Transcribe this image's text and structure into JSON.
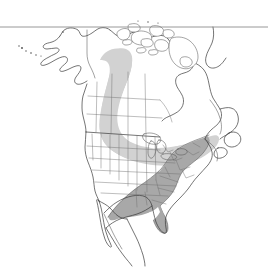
{
  "figure": {
    "kind": "species-range-map",
    "region": "North America",
    "background_color": "#ffffff",
    "width": 268,
    "height": 267
  },
  "frame": {
    "top_rule": {
      "name": "top-horizontal-rule",
      "y": 27,
      "x_start": 0,
      "x_end": 268,
      "color": "#7d7d7d"
    }
  },
  "styles": {
    "coastline_color": "#3a3a3a",
    "internal_border_color": "#6e6e6e",
    "range_light_color": "#d2d2d2",
    "range_dark_color": "#a8a8a8",
    "range_dark_edge_color": "#5a5a5a",
    "land_fill": "#ffffff"
  },
  "range_layers": [
    {
      "id": "range-light",
      "label": "Light shaded range band",
      "color": "#d2d2d2",
      "description": "Broad diagonal band from northwestern Canada southeast across the Prairie provinces and the central and eastern United States to the Atlantic coast."
    },
    {
      "id": "range-dark",
      "label": "Dark shaded core range",
      "color": "#a8a8a8",
      "description": "Southeastern United States from the lower Mississippi valley and eastern Texas east to the Atlantic, including Florida, extending southwest into northeastern Mexico."
    }
  ],
  "geography": {
    "areas": [
      "Alaska",
      "Aleutian Islands",
      "Canada",
      "Canadian Arctic Archipelago",
      "Greenland",
      "Hudson Bay",
      "Newfoundland",
      "Nova Scotia",
      "Great Lakes",
      "United States",
      "Florida",
      "Baja California",
      "Mexico"
    ]
  }
}
